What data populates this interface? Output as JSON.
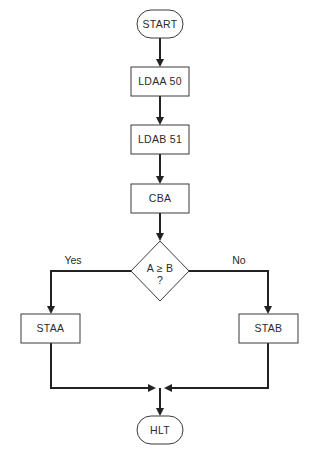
{
  "diagram": {
    "type": "flowchart",
    "nodes": {
      "start": {
        "label": "START",
        "shape": "terminator"
      },
      "ldaa": {
        "label": "LDAA 50",
        "shape": "process"
      },
      "ldab": {
        "label": "LDAB 51",
        "shape": "process"
      },
      "cba": {
        "label": "CBA",
        "shape": "process"
      },
      "decision": {
        "label": "A ≥ B",
        "label_line2": "?",
        "shape": "decision"
      },
      "staa": {
        "label": "STAA",
        "shape": "process"
      },
      "stab": {
        "label": "STAB",
        "shape": "process"
      },
      "hlt": {
        "label": "HLT",
        "shape": "terminator"
      }
    },
    "edges": {
      "yes_label": "Yes",
      "no_label": "No"
    },
    "connections": [
      {
        "from": "START",
        "to": "LDAA 50"
      },
      {
        "from": "LDAA 50",
        "to": "LDAB 51"
      },
      {
        "from": "LDAB 51",
        "to": "CBA"
      },
      {
        "from": "CBA",
        "to": "A ≥ B ?"
      },
      {
        "from": "A ≥ B ?",
        "to": "STAA",
        "label": "Yes"
      },
      {
        "from": "A ≥ B ?",
        "to": "STAB",
        "label": "No"
      },
      {
        "from": "STAA",
        "to": "HLT"
      },
      {
        "from": "STAB",
        "to": "HLT"
      }
    ],
    "colors": {
      "line": "#222222",
      "border": "#3a3a3a",
      "text": "#2a2a2a",
      "background": "#ffffff"
    }
  }
}
